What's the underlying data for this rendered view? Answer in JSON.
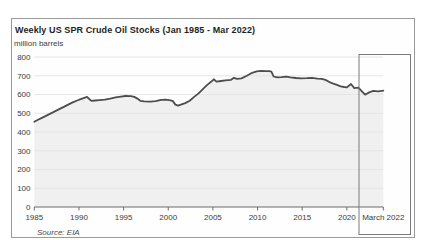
{
  "chart": {
    "title": "Weekly US SPR Crude Oil Stocks (Jan 1985 - Mar 2022)",
    "unit_label": "million barrels",
    "source_note": "Source: EIA",
    "highlight_label": "March 2022"
  },
  "colors": {
    "line": "#4d4d4d",
    "area_fill": "#f0f0f0",
    "gridline": "#e3e3e3",
    "axis": "#6b6b6b",
    "tick_text": "#3b3b3b",
    "highlight_box": "#7a7a7a",
    "figure_border": "#999999"
  },
  "chart_data": {
    "type": "area",
    "title": "Weekly US SPR Crude Oil Stocks (Jan 1985 - Mar 2022)",
    "ylabel": "million barrels",
    "xlabel": "",
    "ylim": [
      0,
      800
    ],
    "y_ticks": [
      0,
      100,
      200,
      300,
      400,
      500,
      600,
      700,
      800
    ],
    "x_ticks": [
      {
        "label": "1985",
        "year": 1985
      },
      {
        "label": "1990",
        "year": 1990
      },
      {
        "label": "1995",
        "year": 1995
      },
      {
        "label": "2000",
        "year": 2000
      },
      {
        "label": "2005",
        "year": 2005
      },
      {
        "label": "2010",
        "year": 2010
      },
      {
        "label": "2015",
        "year": 2015
      },
      {
        "label": "2020",
        "year": 2020
      },
      {
        "label": "March 2022",
        "year": 2022.2
      }
    ],
    "grid": true,
    "legend": false,
    "source": "EIA",
    "annotations": [
      {
        "type": "highlight-box",
        "label": "March 2022"
      }
    ],
    "series": [
      {
        "name": "US SPR crude oil stocks (million barrels)",
        "points": [
          [
            1985.0,
            455
          ],
          [
            1985.4,
            465
          ],
          [
            1985.8,
            474
          ],
          [
            1986.3,
            486
          ],
          [
            1986.8,
            498
          ],
          [
            1987.3,
            510
          ],
          [
            1987.8,
            522
          ],
          [
            1988.3,
            534
          ],
          [
            1988.8,
            546
          ],
          [
            1989.3,
            558
          ],
          [
            1989.8,
            568
          ],
          [
            1990.2,
            575
          ],
          [
            1990.6,
            582
          ],
          [
            1990.9,
            587
          ],
          [
            1991.15,
            576
          ],
          [
            1991.4,
            566
          ],
          [
            1991.8,
            568
          ],
          [
            1992.3,
            570
          ],
          [
            1992.9,
            573
          ],
          [
            1993.5,
            578
          ],
          [
            1994.1,
            585
          ],
          [
            1994.7,
            589
          ],
          [
            1995.2,
            592
          ],
          [
            1995.8,
            591
          ],
          [
            1996.2,
            587
          ],
          [
            1996.55,
            578
          ],
          [
            1996.9,
            566
          ],
          [
            1997.3,
            563
          ],
          [
            1998.0,
            562
          ],
          [
            1998.6,
            565
          ],
          [
            1999.2,
            571
          ],
          [
            1999.7,
            573
          ],
          [
            2000.1,
            570
          ],
          [
            2000.5,
            566
          ],
          [
            2000.8,
            546
          ],
          [
            2001.1,
            541
          ],
          [
            2001.5,
            547
          ],
          [
            2001.9,
            554
          ],
          [
            2002.4,
            567
          ],
          [
            2002.9,
            587
          ],
          [
            2003.4,
            606
          ],
          [
            2003.9,
            630
          ],
          [
            2004.4,
            653
          ],
          [
            2004.8,
            668
          ],
          [
            2005.1,
            681
          ],
          [
            2005.4,
            669
          ],
          [
            2005.9,
            672
          ],
          [
            2006.4,
            675
          ],
          [
            2007.0,
            678
          ],
          [
            2007.35,
            689
          ],
          [
            2007.7,
            683
          ],
          [
            2008.2,
            686
          ],
          [
            2008.8,
            700
          ],
          [
            2009.4,
            716
          ],
          [
            2009.9,
            723
          ],
          [
            2010.4,
            726
          ],
          [
            2010.9,
            725
          ],
          [
            2011.3,
            725
          ],
          [
            2011.55,
            722
          ],
          [
            2011.8,
            696
          ],
          [
            2012.2,
            691
          ],
          [
            2012.7,
            693
          ],
          [
            2013.2,
            695
          ],
          [
            2013.7,
            691
          ],
          [
            2014.3,
            688
          ],
          [
            2014.9,
            686
          ],
          [
            2015.5,
            687
          ],
          [
            2016.1,
            689
          ],
          [
            2016.7,
            685
          ],
          [
            2017.2,
            683
          ],
          [
            2017.6,
            678
          ],
          [
            2018.0,
            668
          ],
          [
            2018.4,
            660
          ],
          [
            2018.9,
            651
          ],
          [
            2019.3,
            644
          ],
          [
            2019.7,
            640
          ],
          [
            2020.0,
            638
          ],
          [
            2020.25,
            656
          ],
          [
            2020.45,
            634
          ],
          [
            2020.7,
            637
          ],
          [
            2020.95,
            613
          ],
          [
            2021.1,
            599
          ],
          [
            2021.35,
            611
          ],
          [
            2021.6,
            619
          ],
          [
            2021.9,
            617
          ],
          [
            2022.2,
            621
          ]
        ]
      }
    ]
  }
}
